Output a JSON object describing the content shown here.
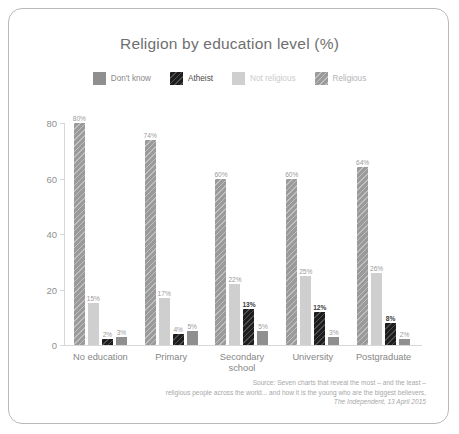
{
  "chart_data": {
    "type": "bar",
    "title": "Religion by education level (%)",
    "xlabel": "",
    "ylabel": "",
    "ylim": [
      0,
      80
    ],
    "yticks": [
      0,
      20,
      40,
      60,
      80
    ],
    "grid": false,
    "legend_position": "top-center",
    "categories": [
      "No education",
      "Primary",
      "Secondary school",
      "University",
      "Postgraduate"
    ],
    "category_lines": [
      [
        "No education"
      ],
      [
        "Primary"
      ],
      [
        "Secondary",
        "school"
      ],
      [
        "University"
      ],
      [
        "Postgraduate"
      ]
    ],
    "series": [
      {
        "name": "Religious",
        "key": "religious",
        "color": "#9a9a9a",
        "values": [
          80,
          74,
          60,
          60,
          64
        ],
        "labels": [
          "80%",
          "74%",
          "60%",
          "60%",
          "64%"
        ]
      },
      {
        "name": "Not religious",
        "key": "notreligious",
        "color": "#cfcfcf",
        "values": [
          15,
          17,
          22,
          25,
          26
        ],
        "labels": [
          "15%",
          "17%",
          "22%",
          "25%",
          "26%"
        ]
      },
      {
        "name": "Atheist",
        "key": "atheist",
        "color": "#1d1d1d",
        "values": [
          2,
          4,
          13,
          12,
          8
        ],
        "labels": [
          "2%",
          "4%",
          "13%",
          "12%",
          "8%"
        ]
      },
      {
        "name": "Don't know",
        "key": "dontknow",
        "color": "#8f8f8f",
        "values": [
          3,
          5,
          5,
          3,
          2
        ],
        "labels": [
          "3%",
          "5%",
          "5%",
          "3%",
          "2%"
        ]
      }
    ]
  },
  "legend": {
    "items": [
      {
        "label": "Don't know",
        "key": "dontknow"
      },
      {
        "label": "Atheist",
        "key": "atheist"
      },
      {
        "label": "Not religious",
        "key": "notreligious"
      },
      {
        "label": "Religious",
        "key": "religious"
      }
    ]
  },
  "source": {
    "line1": "Source: Seven charts that reveal the most – and the least –",
    "line2": "religious people across the world... and how it is the young who are the biggest believers,",
    "line3": "The Independent, 13 April 2015"
  }
}
